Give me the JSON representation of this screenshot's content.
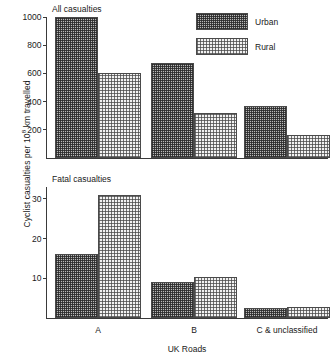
{
  "chart_data": {
    "type": "bar",
    "title": "",
    "xlabel": "UK Roads",
    "ylabel": "Cyclist casualties per 10⁸ km travelled",
    "ylabel_prefix": "Cyclist casualties per 10",
    "ylabel_exponent": "8",
    "ylabel_suffix": " km travelled",
    "categories": [
      "A",
      "B",
      "C & unclassified"
    ],
    "legend": {
      "position": "top-right",
      "entries": [
        {
          "name": "Urban",
          "pattern": "dense-dark-dots",
          "color": "#6e6e6e"
        },
        {
          "name": "Rural",
          "pattern": "sparse-light-dots",
          "color": "#e0e0e0"
        }
      ]
    },
    "panels": [
      {
        "subtitle": "All casualties",
        "ylim": [
          0,
          1000
        ],
        "yticks": [
          200,
          400,
          600,
          800,
          1000
        ],
        "grid": false,
        "series": [
          {
            "name": "Urban",
            "values": [
              1000,
              672,
              368
            ]
          },
          {
            "name": "Rural",
            "values": [
              604,
              320,
              163
            ]
          }
        ]
      },
      {
        "subtitle": "Fatal casualties",
        "ylim": [
          0,
          33
        ],
        "yticks": [
          10,
          20,
          30
        ],
        "grid": false,
        "series": [
          {
            "name": "Urban",
            "values": [
              16.2,
              9.0,
              2.5
            ]
          },
          {
            "name": "Rural",
            "values": [
              31.0,
              10.4,
              2.8
            ]
          }
        ]
      }
    ]
  }
}
